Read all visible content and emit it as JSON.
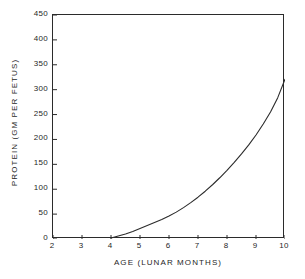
{
  "chart_data": {
    "type": "line",
    "title": "",
    "xlabel": "AGE (LUNAR MONTHS)",
    "ylabel": "PROTEIN (GM PER FETUS)",
    "xlim": [
      2,
      10
    ],
    "ylim": [
      0,
      450
    ],
    "xticks": [
      2,
      3,
      4,
      5,
      6,
      7,
      8,
      9,
      10
    ],
    "xtick_labels": [
      "2",
      "3",
      "4",
      "5",
      "6",
      "7",
      "8",
      "9",
      "10"
    ],
    "yticks": [
      0,
      50,
      100,
      150,
      200,
      250,
      300,
      350,
      400,
      450
    ],
    "ytick_labels": [
      "0",
      "50",
      "100",
      "150",
      "200",
      "250",
      "300",
      "350",
      "400",
      "450"
    ],
    "grid": false,
    "legend": "none",
    "tick_direction": "in",
    "line_color": "#2b2b2b",
    "frame_color": "#2b2b2b",
    "background_color": "#ffffff",
    "series": [
      {
        "name": "Protein",
        "x": [
          4.0,
          4.25,
          4.5,
          4.75,
          5.0,
          5.25,
          5.5,
          5.75,
          6.0,
          6.25,
          6.5,
          6.75,
          7.0,
          7.25,
          7.5,
          7.75,
          8.0,
          8.25,
          8.5,
          8.75,
          9.0,
          9.25,
          9.5,
          9.75,
          10.0
        ],
        "y": [
          2,
          6,
          10,
          15,
          21,
          27,
          33,
          39,
          46,
          54,
          63,
          73,
          84,
          96,
          109,
          123,
          138,
          154,
          171,
          189,
          209,
          231,
          255,
          284,
          321
        ]
      }
    ]
  },
  "axis": {
    "x_title": "AGE (LUNAR MONTHS)",
    "y_title": "PROTEIN (GM PER FETUS)"
  }
}
